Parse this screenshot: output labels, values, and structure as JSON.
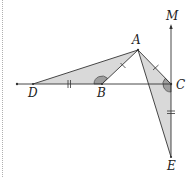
{
  "diagram": {
    "type": "geometry-figure",
    "colors": {
      "line": "#333333",
      "fill": "#d9d9d9",
      "angle_fill": "#9e9e9e",
      "border": "#b0b0b0"
    },
    "points": [
      {
        "name": "A",
        "label": "A",
        "x": 138,
        "y": 50,
        "lx": 136,
        "ly": 44
      },
      {
        "name": "B",
        "label": "B",
        "x": 102,
        "y": 84,
        "lx": 101,
        "ly": 97
      },
      {
        "name": "C",
        "label": "C",
        "x": 171,
        "y": 84,
        "lx": 182,
        "ly": 89
      },
      {
        "name": "D",
        "label": "D",
        "x": 33,
        "y": 84,
        "lx": 32,
        "ly": 97
      },
      {
        "name": "E",
        "label": "E",
        "x": 171,
        "y": 157,
        "lx": 171,
        "ly": 170
      },
      {
        "name": "M",
        "label": "M",
        "x": 171,
        "y": 26,
        "lx": 171,
        "ly": 20
      }
    ],
    "line_start": {
      "x": 17,
      "y": 84
    },
    "shaded_triangles": [
      "ABD",
      "ACE"
    ],
    "segments": [
      "DC",
      "AB",
      "AD",
      "AC",
      "AE",
      "ME"
    ],
    "equal_marks": [
      {
        "segments": [
          "DB",
          "CE"
        ],
        "ticks": 2
      },
      {
        "segments": [
          "AB",
          "AC"
        ],
        "ticks": 1
      }
    ],
    "angle_marks": [
      "ABC",
      "ACE"
    ]
  }
}
